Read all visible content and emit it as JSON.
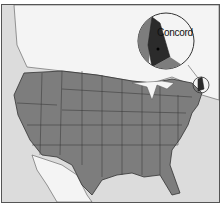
{
  "map": {
    "title": "",
    "highlighted_state": "New Hampshire",
    "inset_label": "Concord",
    "colors": {
      "ocean": "#dcdcdc",
      "canada": "#f4f4f4",
      "usa": "#7d7d7d",
      "highlight": "#2b2b2b",
      "border": "#333333"
    }
  }
}
